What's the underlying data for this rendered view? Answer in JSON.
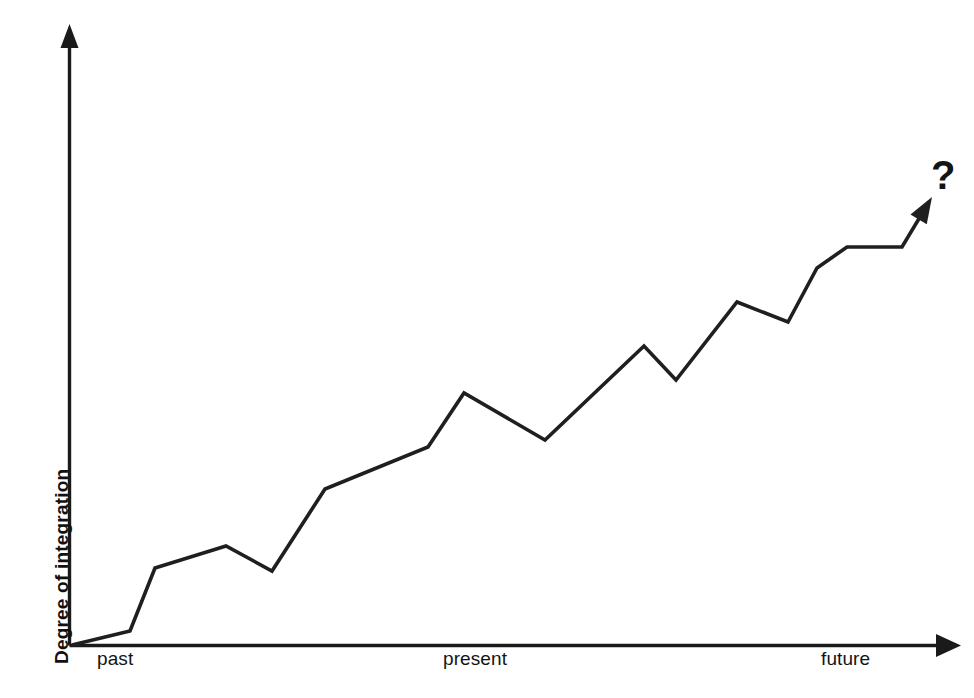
{
  "chart_data": {
    "type": "line",
    "title": "",
    "subtitle": "",
    "xlabel": "",
    "ylabel": "Degree of integration",
    "x_tick_labels": [
      "past",
      "present",
      "future"
    ],
    "x_tick_positions": [
      0.07,
      0.49,
      0.88
    ],
    "y_tick_labels": [],
    "xlim": [
      0,
      1
    ],
    "ylim": [
      0,
      1
    ],
    "grid": false,
    "legend": null,
    "annotations": [
      {
        "name": "uncertainty-question-mark",
        "text": "?",
        "x": 0.985,
        "y": 1.0,
        "note": "bold question mark at the tip of the rising arrow"
      }
    ],
    "axis_style": {
      "x_axis": "arrow pointing right",
      "y_axis": "arrow pointing up",
      "axis_color": "#1a1a1a",
      "line_color": "#1f1f1f",
      "line_width_px": 3.6
    },
    "series": [
      {
        "name": "Degree of integration over time",
        "terminates_with_arrow": true,
        "points": [
          {
            "px": 72,
            "py": 645,
            "x": 0.0,
            "y": 0.0
          },
          {
            "px": 130,
            "py": 631,
            "x": 0.065,
            "y": 0.023
          },
          {
            "px": 155,
            "py": 568,
            "x": 0.093,
            "y": 0.124
          },
          {
            "px": 226,
            "py": 546,
            "x": 0.173,
            "y": 0.16
          },
          {
            "px": 272,
            "py": 571,
            "x": 0.225,
            "y": 0.119
          },
          {
            "px": 325,
            "py": 489,
            "x": 0.285,
            "y": 0.252
          },
          {
            "px": 428,
            "py": 447,
            "x": 0.401,
            "y": 0.319
          },
          {
            "px": 464,
            "py": 393,
            "x": 0.441,
            "y": 0.407
          },
          {
            "px": 545,
            "py": 440,
            "x": 0.533,
            "y": 0.331
          },
          {
            "px": 644,
            "py": 346,
            "x": 0.644,
            "y": 0.483
          },
          {
            "px": 676,
            "py": 380,
            "x": 0.68,
            "y": 0.428
          },
          {
            "px": 737,
            "py": 302,
            "x": 0.749,
            "y": 0.554
          },
          {
            "px": 788,
            "py": 322,
            "x": 0.806,
            "y": 0.522
          },
          {
            "px": 817,
            "py": 268,
            "x": 0.839,
            "y": 0.609
          },
          {
            "px": 847,
            "py": 247,
            "x": 0.873,
            "y": 0.643
          },
          {
            "px": 902,
            "py": 247,
            "x": 0.935,
            "y": 0.643
          },
          {
            "px": 932,
            "py": 197,
            "x": 0.968,
            "y": 0.724
          }
        ]
      }
    ]
  },
  "chart": {
    "ylabel": "Degree of integration",
    "xticks": [
      {
        "label": "past",
        "left": 97,
        "top": 648
      },
      {
        "label": "present",
        "left": 443,
        "top": 648
      },
      {
        "label": "future",
        "left": 821,
        "top": 648
      }
    ],
    "question_mark": "?",
    "colors": {
      "background": "#ffffff",
      "axis": "#1a1a1a",
      "data_line": "#1f1f1f",
      "text": "#141414"
    }
  }
}
